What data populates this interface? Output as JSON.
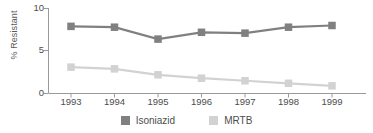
{
  "chart_data": {
    "type": "line",
    "title": "",
    "subtitle": "",
    "xlabel": "",
    "ylabel": "% Resistant",
    "categories": [
      "1993",
      "1994",
      "1995",
      "1996",
      "1997",
      "1998",
      "1999"
    ],
    "x": [
      1993,
      1994,
      1995,
      1996,
      1997,
      1998,
      1999
    ],
    "series": [
      {
        "name": "Isoniazid",
        "color": "#808080",
        "marker": "square",
        "values": [
          7.9,
          7.8,
          6.4,
          7.2,
          7.1,
          7.8,
          8.0
        ]
      },
      {
        "name": "MRTB",
        "color": "#d2d2d2",
        "marker": "square",
        "values": [
          3.1,
          2.9,
          2.2,
          1.8,
          1.5,
          1.2,
          0.9
        ]
      }
    ],
    "ylim": [
      0,
      10
    ],
    "yticks": [
      0,
      5,
      10
    ],
    "ytick_labels": [
      "0",
      "5",
      "10"
    ],
    "xtick_labels": [
      "1993",
      "1994",
      "1995",
      "1996",
      "1997",
      "1998",
      "1999"
    ],
    "grid": false,
    "legend": {
      "position": "bottom",
      "entries": [
        {
          "label": "Isoniazid",
          "color": "#808080"
        },
        {
          "label": "MRTB",
          "color": "#d2d2d2"
        }
      ]
    },
    "axis_color": "#9b9b9b",
    "text_color": "#4d4d4d"
  }
}
